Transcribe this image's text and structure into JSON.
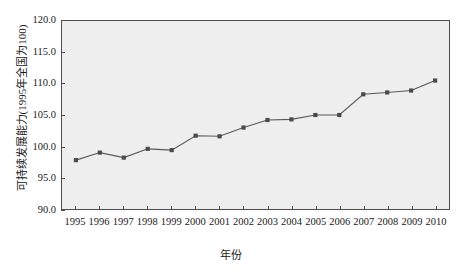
{
  "chart_data": {
    "type": "line",
    "title": "",
    "xlabel": "年份",
    "ylabel": "可持续发展能力(1995年全国为100)",
    "categories": [
      "1995",
      "1996",
      "1997",
      "1998",
      "1999",
      "2000",
      "2001",
      "2002",
      "2003",
      "2004",
      "2005",
      "2006",
      "2007",
      "2008",
      "2009",
      "2010"
    ],
    "values": [
      97.8,
      99.0,
      98.2,
      99.6,
      99.4,
      101.7,
      101.6,
      103.0,
      104.2,
      104.3,
      105.0,
      105.0,
      108.3,
      108.6,
      108.9,
      110.5
    ],
    "series": [
      {
        "name": "可持续发展能力",
        "values": [
          97.8,
          99.0,
          98.2,
          99.6,
          99.4,
          101.7,
          101.6,
          103.0,
          104.2,
          104.3,
          105.0,
          105.0,
          108.3,
          108.6,
          108.9,
          110.5
        ]
      }
    ],
    "ylim": [
      90.0,
      120.0
    ],
    "yticks": [
      "90.0",
      "95.0",
      "100.0",
      "105.0",
      "110.0",
      "115.0",
      "120.0"
    ],
    "ytick_values": [
      90.0,
      95.0,
      100.0,
      105.0,
      110.0,
      115.0,
      120.0
    ],
    "xticks": [
      "1995",
      "1996",
      "1997",
      "1998",
      "1999",
      "2000",
      "2001",
      "2002",
      "2003",
      "2004",
      "2005",
      "2006",
      "2007",
      "2008",
      "2009",
      "2010"
    ],
    "grid": false,
    "legend": "none",
    "plot_background": "#eeeeee",
    "line_color": "#595959",
    "marker_color": "#4a4a4a",
    "axis_color": "#4d4d4d"
  }
}
